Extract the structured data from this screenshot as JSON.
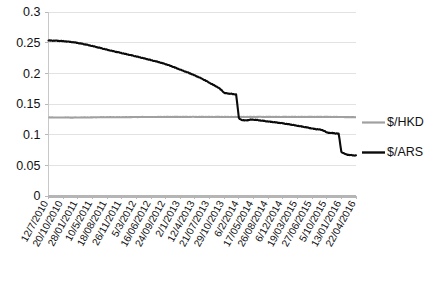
{
  "chart_data": {
    "type": "line",
    "title": "",
    "xlabel": "",
    "ylabel": "",
    "ylim": [
      0,
      0.3
    ],
    "yticks": [
      "0",
      "0.05",
      "0.1",
      "0.15",
      "0.2",
      "0.25",
      "0.3"
    ],
    "ytick_values": [
      0,
      0.05,
      0.1,
      0.15,
      0.2,
      0.25,
      0.3
    ],
    "grid": true,
    "legend_position": "right",
    "categories": [
      "12/7/2010",
      "20/10/2010",
      "28/01/2011",
      "10/5/2011",
      "18/08/2011",
      "26/11/2011",
      "5/3/2012",
      "16/06/2012",
      "24/09/2012",
      "2/1/2013",
      "12/4/2013",
      "21/07/2013",
      "29/10/2013",
      "6/2/2014",
      "17/05/2014",
      "26/08/2014",
      "6/12/2014",
      "19/03/2015",
      "27/06/2015",
      "5/10/2015",
      "13/01/2016",
      "22/04/2016"
    ],
    "series": [
      {
        "name": "$/HKD",
        "color": "#a0a0a0",
        "values": [
          0.128,
          0.128,
          0.128,
          0.1283,
          0.1285,
          0.1285,
          0.1288,
          0.1288,
          0.129,
          0.129,
          0.129,
          0.129,
          0.129,
          0.1288,
          0.129,
          0.129,
          0.129,
          0.129,
          0.129,
          0.129,
          0.1288,
          0.1285
        ]
      },
      {
        "name": "$/ARS",
        "color": "#0b0b0b",
        "values": [
          0.2535,
          0.2525,
          0.2495,
          0.2445,
          0.2385,
          0.233,
          0.2275,
          0.2215,
          0.215,
          0.206,
          0.1965,
          0.1845,
          0.168,
          0.127,
          0.1245,
          0.1215,
          0.1185,
          0.1145,
          0.11,
          0.1035,
          0.072,
          0.066
        ]
      }
    ],
    "annotations": {
      "drop_1": "sharp devaluation near 6/2/2014 from ~0.155 to ~0.125",
      "drop_2": "sharp devaluation near 13/01/2016 from ~0.102 to ~0.075"
    }
  },
  "legend": {
    "items": [
      {
        "label": "$/HKD",
        "color": "#a0a0a0"
      },
      {
        "label": "$/ARS",
        "color": "#0b0b0b"
      }
    ]
  }
}
